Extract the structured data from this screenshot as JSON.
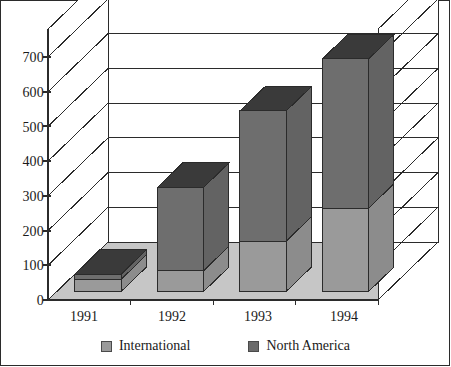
{
  "chart_data": {
    "type": "bar",
    "subtype": "stacked-3d-column",
    "title": "",
    "subtitle": "",
    "xlabel": "",
    "ylabel": "",
    "categories": [
      "1991",
      "1992",
      "1993",
      "1994"
    ],
    "series": [
      {
        "name": "International",
        "values": [
          35,
          60,
          145,
          240
        ],
        "color": "#9a9a9a"
      },
      {
        "name": "North America",
        "values": [
          15,
          240,
          375,
          430
        ],
        "color": "#6b6b6b"
      }
    ],
    "totals": [
      50,
      300,
      520,
      670
    ],
    "ylim": [
      0,
      780
    ],
    "yticks": [
      0,
      100,
      200,
      300,
      400,
      500,
      600,
      700
    ],
    "ytick_labels": [
      "0",
      "100",
      "200",
      "300",
      "400",
      "500",
      "600",
      "700"
    ],
    "grid": true,
    "grid_style": "horizontal-walls-3d",
    "legend_position": "bottom-center",
    "legend_entries": [
      "International",
      "North America"
    ],
    "annotations": []
  },
  "axes": {
    "y_tick_labels": [
      "700",
      "600",
      "500",
      "400",
      "300",
      "200",
      "100",
      "0"
    ],
    "x_tick_labels": [
      "1991",
      "1992",
      "1993",
      "1994"
    ]
  },
  "legend": {
    "items": [
      {
        "label": "International",
        "swatch": "#9a9a9a"
      },
      {
        "label": "North America",
        "swatch": "#6b6b6b"
      }
    ]
  },
  "colors": {
    "international_front": "#9a9a9a",
    "international_side": "#8c8c8c",
    "international_top": "#b4b4b4",
    "north_america_front": "#6e6e6e",
    "north_america_side": "#636363",
    "north_america_top": "#3a3a3a",
    "floor": "#c6c6c6",
    "wall": "#ffffff",
    "line": "#2b2b2b",
    "frame": "#2b2b2b"
  }
}
